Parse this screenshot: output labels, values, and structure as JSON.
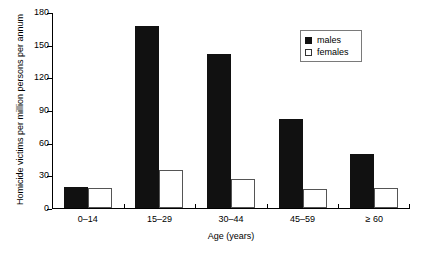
{
  "chart_data": {
    "type": "bar",
    "title": "",
    "xlabel": "Age (years)",
    "ylabel": "Homicide victims per million persons per annum",
    "categories": [
      "0–14",
      "15–29",
      "30–44",
      "45–59",
      "≥ 60"
    ],
    "series": [
      {
        "name": "males",
        "color": "#111111",
        "values": [
          19,
          167,
          141,
          82,
          50
        ]
      },
      {
        "name": "females",
        "color": "#ffffff",
        "values": [
          18,
          35,
          27,
          17,
          18
        ]
      }
    ],
    "ylim": [
      0,
      180
    ],
    "ytick_labels": [
      "0",
      "30",
      "60",
      "90",
      "120",
      "150",
      "180"
    ],
    "ytick_values": [
      0,
      30,
      60,
      90,
      120,
      150,
      180
    ],
    "grid": false,
    "legend_position": "top-right",
    "legend_entries": [
      "males",
      "females"
    ]
  },
  "legend": {
    "males_label": "males",
    "females_label": "females"
  },
  "caption": {
    "text": ""
  }
}
